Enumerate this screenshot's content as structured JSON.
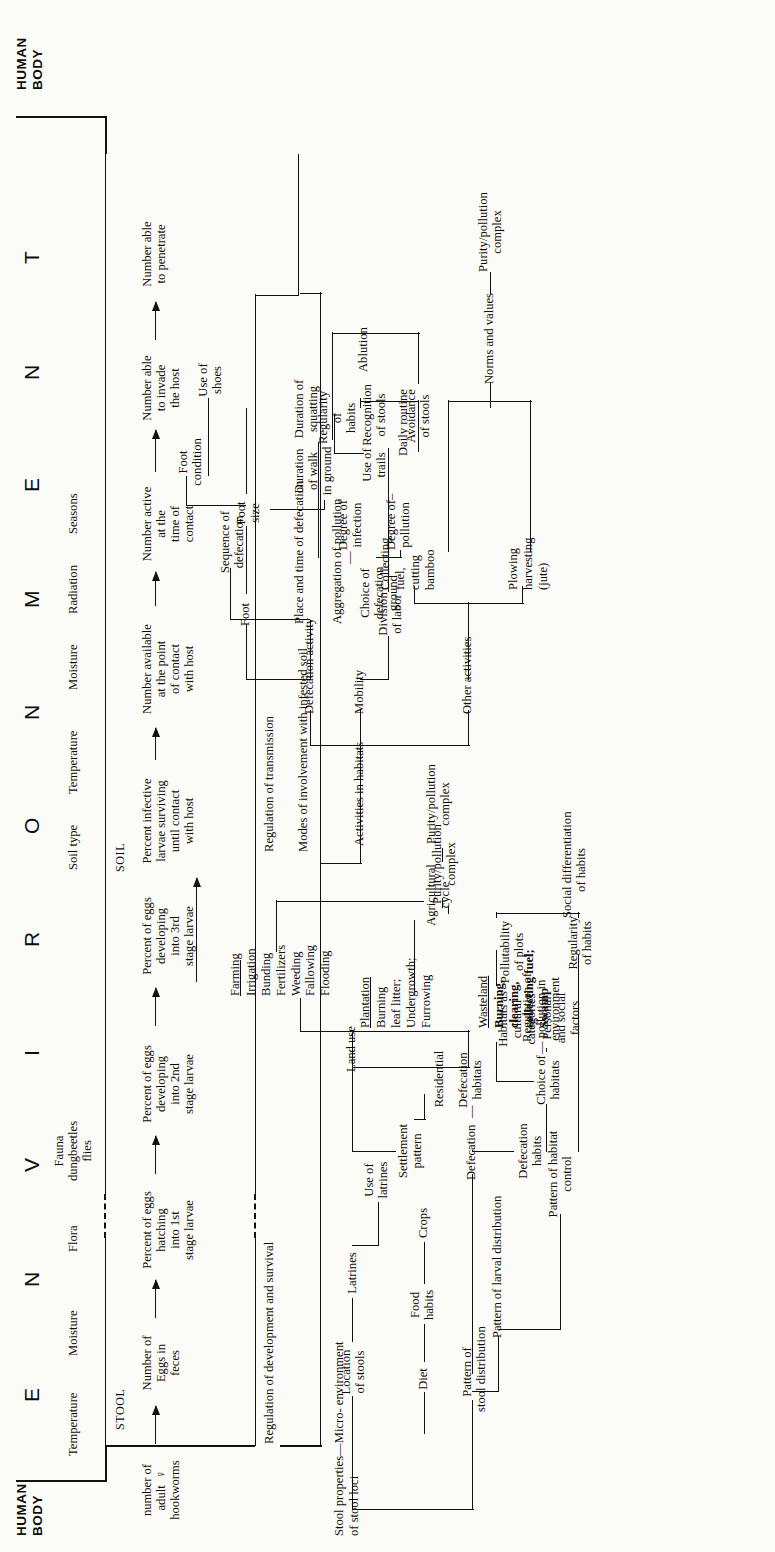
{
  "figure": {
    "spine_letters": [
      "E",
      "N",
      "V",
      "I",
      "R",
      "O",
      "N",
      "M",
      "E",
      "N",
      "T"
    ],
    "left_endpoint": "HUMAN\nBODY",
    "right_endpoint": "HUMAN\nBODY"
  },
  "env_factors_row": [
    {
      "label": "Temperature"
    },
    {
      "label": "Moisture"
    },
    {
      "label": "Flora"
    },
    {
      "label": "Fauna\ndungbeetles\nflies"
    },
    {
      "label": "Soil type"
    },
    {
      "label": "Temperature"
    },
    {
      "label": "Moisture"
    },
    {
      "label": "Radiation"
    },
    {
      "label": "Seasons"
    }
  ],
  "compartments": [
    {
      "label": "STOOL"
    },
    {
      "label": "SOIL"
    }
  ],
  "life_cycle_chain": [
    {
      "label": "number of\nadult  ♀\nhookworms"
    },
    {
      "label": "Number of\nEggs in\nfeces"
    },
    {
      "label": "Percent of eggs\nhatching\ninto 1st\nstage larvae"
    },
    {
      "label": "Percent of eggs\ndeveloping\ninto 2nd\nstage larvae"
    },
    {
      "label": "Percent of eggs\ndeveloping\ninto 3rd\nstage larvae"
    },
    {
      "label": "Percent infective\nlarvae surviving\nuntil contact\nwith host"
    },
    {
      "label": "Number available\nat the point\nof contact\nwith host"
    },
    {
      "label": "Number active\nat the\ntime of\ncontact"
    },
    {
      "label": "Number able\nto invade\nthe host"
    },
    {
      "label": "Number able\nto penetrate"
    }
  ],
  "regulation_bands": [
    {
      "label": "Regulation of development and survival"
    },
    {
      "label": "Regulation of transmission"
    }
  ],
  "behaviour_root": {
    "label": "Modes of involvement with infested soil"
  },
  "stool_branch": {
    "root": "Stool properties—Micro- environment\nof stool loci",
    "diet": "Diet",
    "food_habits": "Food\nhabits",
    "crops": "Crops",
    "location_of_stools": "Location\nof stools",
    "latrines": "Latrines",
    "use_of_latrines": "Use of\nlatrines",
    "pattern_of_stool_distribution": "Pattern of\nstool distribution",
    "pattern_of_larval_distribution": "Pattern of larval distribution",
    "pattern_of_habitat_control": "Pattern of habitat\ncontrol"
  },
  "defecation_branch": {
    "defecation_habits": "Defecation\nhabits",
    "defecation_label": "Defecation",
    "defecation_habitats": "Defecation\nhabitats",
    "residential": "Residential",
    "choice_of_habitats": "Choice of\nhabitats",
    "regulation_of_pollution": "Regulation of\npollution in\nenvironment",
    "personal_and_social_factors": "Personal\nand social\nfactors",
    "habitats_as_cultural_categories": "Habitats as\ncultural\ncategories",
    "regularity_of_habits": "Regularity\nof habits",
    "pollutability_of_plots": "Pollutability\nof plots",
    "social_differentiation": "Social differentiation\nof habits",
    "purity_pollution_complex": "Purity/pollution\ncomplex"
  },
  "settlement_branch": {
    "settlement_pattern": "Settlement\npattern",
    "land_use": "Land use",
    "wasteland": {
      "head": "Wasteland",
      "items": "Burning,\nclearing,\ncollecting fuel;\nSwamp"
    },
    "plantation": {
      "head": "Plantation",
      "items": "Burning\nleaf litter;\nUndergrowth;\nFurrowing"
    },
    "farming": {
      "head": "Farming",
      "items": "Irrigation\nBunding\nFertilizers\nWeeding\nFallowing\nFlooding"
    },
    "agricultural_cycle": "Agricultural\ncycle",
    "purity_pollution_complex": "Purity/pollution\ncomplex"
  },
  "activities_branch": {
    "root": "Activities in habitats",
    "mobility": "Mobility",
    "division_of_labor": "Division\nof labor",
    "other_activities": "Other activities",
    "collecting_fuel": "Collecting\nfuel,\ncutting\nbamboo",
    "plowing_harvesting": "Plowing\nharvesting\n(jute)",
    "daily_routine": "Daily routine",
    "norms_and_values": "Norms and values",
    "purity_pollution_complex": "Purity/pollution\ncomplex"
  },
  "defecation_activity_branch": {
    "root": "Defecation activity",
    "place_and_time": "Place and time of defecation",
    "sequence_of_defecation": "Sequence of\ndefecation",
    "aggregation_of_pollution": "Aggregation of pollution",
    "choice_of_defecation_ground": "Choice of\ndefecation\nground",
    "degree_of_infection": "Degree of\ninfection",
    "duration_of_walk": "Duration\nof walk\nin ground",
    "degree_of_pollution": "Degree of\npollution",
    "use_of_trails": "Use of\ntrails",
    "duration_of_squatting": "Duration of\nsquatting",
    "recognition_of_stools": "Recognition\nof stools",
    "avoidance_of_stools": "Avoidance\nof stools",
    "ablution": "Ablution",
    "regularity_of_habits": "Regularity\nof\nhabits"
  },
  "foot_branch": {
    "foot": "Foot",
    "foot_size": "Foot\nsize",
    "foot_condition": "Foot\ncondition",
    "use_of_shoes": "Use of\nshoes"
  }
}
